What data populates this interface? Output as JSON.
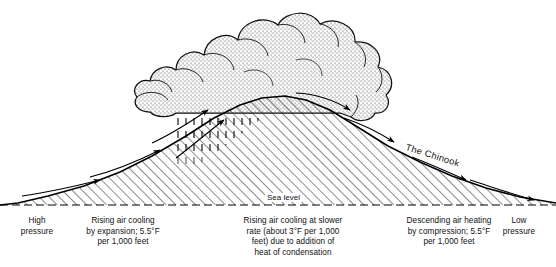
{
  "diagram": {
    "background_color": "#ffffff",
    "ink_color": "#000000"
  },
  "labels": {
    "high_pressure": "High\npressure",
    "low_pressure": "Low\npressure",
    "windward_caption": "Rising air cooling\nby expansion; 5.5°F\nper 1,000 feet",
    "cloud_caption": "Rising air cooling at slower\nrate (about 3°F per 1,000\nfeet) due to addition of\nheat of condensation",
    "leeward_caption": "Descending air heating\nby compression; 5.5°F\nper 1,000 feet",
    "sea_level": "Sea level",
    "chinook": "The Chinook"
  },
  "elements": {
    "cloud": "cumulus-cloud",
    "rain": "rain-shaft",
    "mountain": "hatched-mountain",
    "sea_level_line": "dashed-baseline",
    "windward_arrows": 3,
    "leeward_arrows": 4
  },
  "colors": {
    "ink": "#000000",
    "hatch": "#222222",
    "stipple": "#555555",
    "rain": "#444444"
  }
}
